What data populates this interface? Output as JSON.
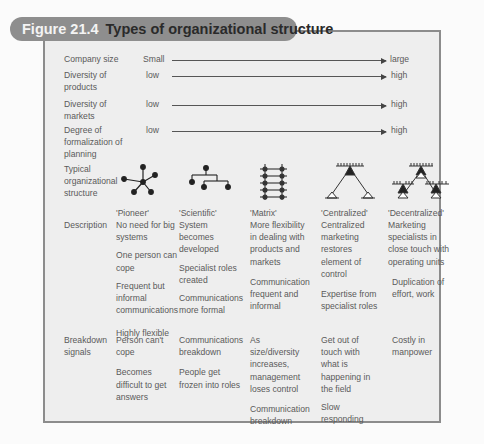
{
  "figure": {
    "number": "Figure 21.4",
    "title": "Types of organizational structure"
  },
  "scales": [
    {
      "label": "Company size",
      "from": "Small",
      "to": "large"
    },
    {
      "label": "Diversity of products",
      "from": "low",
      "to": "high"
    },
    {
      "label": "Diversity of markets",
      "from": "low",
      "to": "high"
    },
    {
      "label": "Degree of formalization of planning",
      "from": "low",
      "to": "high"
    }
  ],
  "row_labels": {
    "structure": "Typical organizational structure",
    "description": "Description",
    "breakdown": "Breakdown signals"
  },
  "types": [
    {
      "name": "'Pioneer'",
      "icon": "star-network-icon",
      "description": [
        "No need for big systems",
        "One person can cope",
        "Frequent but informal communications",
        "Highly flexible"
      ],
      "breakdown": [
        "Person can't cope",
        "Becomes difficult to get answers"
      ]
    },
    {
      "name": "'Scientific'",
      "icon": "hierarchy-tree-icon",
      "description": [
        "System becomes developed",
        "Specialist roles created",
        "Communications more formal"
      ],
      "breakdown": [
        "Communications breakdown",
        "People get frozen into roles"
      ]
    },
    {
      "name": "'Matrix'",
      "icon": "matrix-ladder-icon",
      "description": [
        "More flexibility in dealing with products and markets",
        "Communication frequent and informal"
      ],
      "breakdown": [
        "As size/diversity increases, management loses control",
        "Communication breakdown"
      ]
    },
    {
      "name": "'Centralized'",
      "icon": "centralized-pyramid-icon",
      "description": [
        "Centralized marketing restores element of control",
        "Expertise from specialist roles"
      ],
      "breakdown": [
        "Get out of touch with what is happening in the field",
        "Slow responding"
      ]
    },
    {
      "name": "'Decentralized'",
      "icon": "decentralized-pyramid-icon",
      "description": [
        "Marketing specialists in close touch with operating units",
        "Duplication of effort, work"
      ],
      "breakdown": [
        "Costly in manpower"
      ]
    }
  ],
  "colors": {
    "title_pill": "#8e8e8e",
    "frame_border": "#8c8c8c",
    "frame_fill": "#eeeeee",
    "text": "#5a5a5a"
  }
}
